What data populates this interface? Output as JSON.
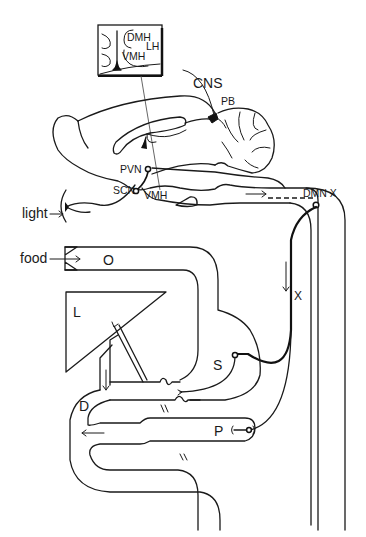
{
  "diagram": {
    "type": "anatomical schematic",
    "inset": {
      "labels": {
        "dmh": "DMH",
        "lh": "LH",
        "vmh": "VMH"
      }
    },
    "brain_labels": {
      "cns": "CNS",
      "pb": "PB",
      "pvn": "PVN",
      "scn": "SCN",
      "vmh": "VMH",
      "dmn": "DMN X"
    },
    "inputs": {
      "light": "light",
      "food": "food"
    },
    "organ_labels": {
      "oesophagus": "O",
      "liver": "L",
      "stomach": "S",
      "duodenum": "D",
      "pancreas": "P",
      "vagus": "X"
    }
  }
}
